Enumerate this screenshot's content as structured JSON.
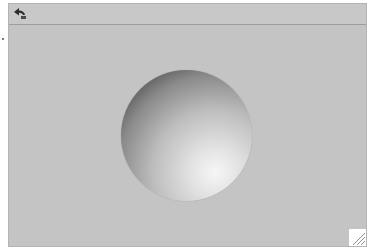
{
  "toolbar": {
    "back_icon": "back-arrow-icon"
  },
  "viewer": {
    "object": "shaded-sphere",
    "background_color": "#c4c4c4",
    "sphere_highlight_color": "#f6f6f6",
    "sphere_shadow_color": "#2a2a2a"
  },
  "resize_handle": {
    "icon": "resize-grip-icon"
  }
}
